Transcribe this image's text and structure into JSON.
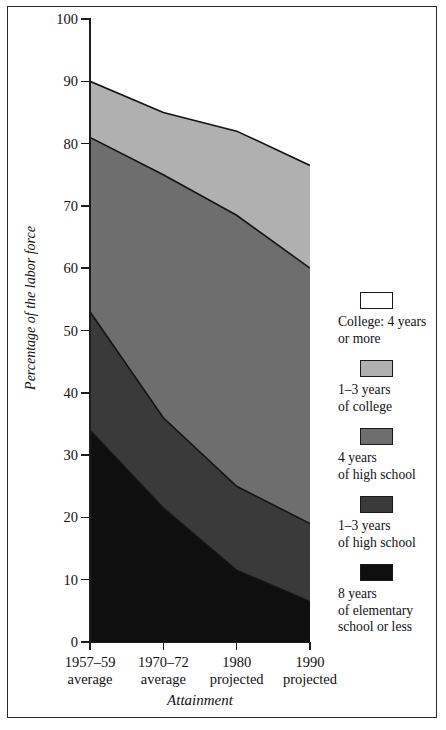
{
  "chart_data": {
    "type": "area",
    "stacked": true,
    "title": "",
    "xlabel": "Attainment",
    "ylabel": "Percentage of the labor force",
    "ylim": [
      0,
      100
    ],
    "grid": false,
    "legend_position": "right",
    "categories": [
      "1957–59 average",
      "1970–72 average",
      "1980 projected",
      "1990 projected"
    ],
    "category_lines": [
      {
        "line1": "1957–59",
        "line2": "average"
      },
      {
        "line1": "1970–72",
        "line2": "average"
      },
      {
        "line1": "1980",
        "line2": "projected"
      },
      {
        "line1": "1990",
        "line2": "projected"
      }
    ],
    "y_ticks": [
      0,
      10,
      20,
      30,
      40,
      50,
      60,
      70,
      80,
      90,
      100
    ],
    "series": [
      {
        "name": "8 years of elementary school or less",
        "legend_lines": [
          "8 years",
          "of elementary",
          "school or less"
        ],
        "color": "#100f0f",
        "values": [
          34.0,
          21.5,
          11.5,
          6.5
        ]
      },
      {
        "name": "1–3 years of high school",
        "legend_lines": [
          "1–3 years",
          "of high school"
        ],
        "color": "#3a3a3a",
        "values": [
          19.0,
          14.5,
          13.5,
          12.5
        ]
      },
      {
        "name": "4 years of high school",
        "legend_lines": [
          "4 years",
          "of high school"
        ],
        "color": "#6e6e6e",
        "values": [
          28.0,
          39.0,
          43.5,
          41.0
        ]
      },
      {
        "name": "1–3 years of college",
        "legend_lines": [
          "1–3 years",
          "of college"
        ],
        "color": "#b0b0b0",
        "values": [
          9.0,
          10.0,
          13.5,
          16.5
        ]
      },
      {
        "name": "College: 4 years or more",
        "legend_lines": [
          "College: 4 years",
          "or more"
        ],
        "color": "#ffffff",
        "values": [
          10.0,
          15.0,
          18.0,
          23.5
        ]
      }
    ],
    "cumulative_boundaries": {
      "note": "Top edge of each stacked band, bottom to top, per category",
      "band1_top": [
        34.0,
        21.5,
        11.5,
        6.5
      ],
      "band2_top": [
        53.0,
        36.0,
        25.0,
        19.0
      ],
      "band3_top": [
        81.0,
        75.0,
        68.5,
        60.0
      ],
      "band4_top": [
        90.0,
        85.0,
        82.0,
        76.5
      ],
      "band5_top": [
        100.0,
        100.0,
        100.0,
        100.0
      ]
    }
  },
  "legend": {
    "entries": [
      {
        "label_line1": "College: 4 years",
        "label_line2": "or more",
        "label_line3": "",
        "color": "#ffffff"
      },
      {
        "label_line1": "1–3 years",
        "label_line2": "of college",
        "label_line3": "",
        "color": "#b0b0b0"
      },
      {
        "label_line1": "4 years",
        "label_line2": "of high school",
        "label_line3": "",
        "color": "#6e6e6e"
      },
      {
        "label_line1": "1–3 years",
        "label_line2": "of high school",
        "label_line3": "",
        "color": "#3a3a3a"
      },
      {
        "label_line1": "8 years",
        "label_line2": "of elementary",
        "label_line3": "school or less",
        "color": "#100f0f"
      }
    ]
  },
  "axes": {
    "y_title": "Percentage of the labor force",
    "x_title": "Attainment",
    "y_labels": [
      "100",
      "90",
      "80",
      "70",
      "60",
      "50",
      "40",
      "30",
      "20",
      "10",
      "0"
    ],
    "x_labels": [
      {
        "line1": "1957–59",
        "line2": "average"
      },
      {
        "line1": "1970–72",
        "line2": "average"
      },
      {
        "line1": "1980",
        "line2": "projected"
      },
      {
        "line1": "1990",
        "line2": "projected"
      }
    ]
  }
}
